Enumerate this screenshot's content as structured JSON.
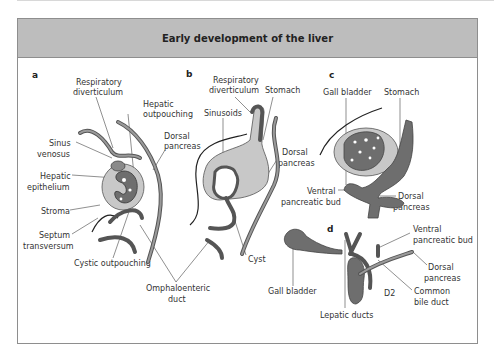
{
  "title": "Early development of the liver",
  "colors": {
    "header_bg": "#bdbdbd",
    "frame_border": "#8e8e8e",
    "organ_dark": "#6e6e6e",
    "stroma_light": "#c8c8c8"
  },
  "panels": {
    "a": {
      "letter": "a",
      "labels": {
        "respiratory": "Respiratory",
        "diverticulum": "diverticulum",
        "hepatic": "Hepatic",
        "outpouching": "outpouching",
        "sinus": "Sinus",
        "venosus": "venosus",
        "dorsal": "Dorsal",
        "pancreas": "pancreas",
        "hepatic_epi": "Hepatic",
        "epithelium": "epithelium",
        "stroma": "Stroma",
        "septum": "Septum",
        "transversum": "transversum",
        "cystic": "Cystic outpouching"
      }
    },
    "b": {
      "letter": "b",
      "labels": {
        "respiratory": "Respiratory",
        "diverticulum": "diverticulum",
        "stomach": "Stomach",
        "sinusoids": "Sinusoids",
        "dorsal": "Dorsal",
        "pancreas": "pancreas",
        "cyst": "Cyst"
      }
    },
    "shared": {
      "omphalo": "Omphaloenteric",
      "duct": "duct"
    },
    "c": {
      "letter": "c",
      "labels": {
        "gall_bladder": "Gall bladder",
        "stomach": "Stomach",
        "ventral": "Ventral",
        "pancreatic_bud": "pancreatic bud",
        "dorsal": "Dorsal",
        "pancreas": "pancreas"
      }
    },
    "d": {
      "letter": "d",
      "labels": {
        "gall_bladder": "Gall bladder",
        "ventral": "Ventral",
        "pancreatic_bud": "pancreatic bud",
        "dorsal": "Dorsal",
        "pancreas": "pancreas",
        "d2": "D2",
        "common": "Common",
        "bile_duct": "bile duct",
        "lepatic": "Lepatic ducts"
      }
    }
  }
}
